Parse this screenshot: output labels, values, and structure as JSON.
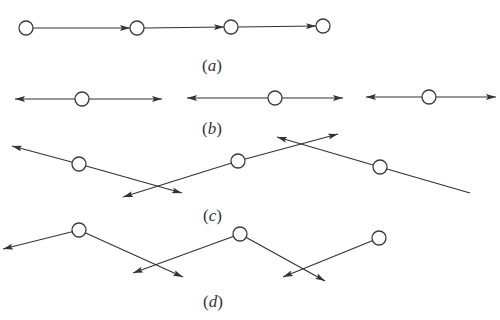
{
  "figure": {
    "style": {
      "line_color": "#333333",
      "node_fill": "#ffffff",
      "node_stroke": "#3a3a3a",
      "node_radius": 7
    },
    "panels": [
      {
        "id": "a",
        "label": "(a)",
        "label_letter": "a",
        "description": "Chain of four nodes connected left-to-right by directed arrows",
        "nodes": [
          {
            "x": 26,
            "y": 28
          },
          {
            "x": 137,
            "y": 28
          },
          {
            "x": 231,
            "y": 27
          },
          {
            "x": 323,
            "y": 26
          }
        ],
        "edges": [
          {
            "from": [
              33,
              28
            ],
            "to": [
              130,
              28
            ],
            "arrow_end": true
          },
          {
            "from": [
              144,
              28
            ],
            "to": [
              224,
              27
            ],
            "arrow_end": true
          },
          {
            "from": [
              238,
              27
            ],
            "to": [
              316,
              26
            ],
            "arrow_end": true
          }
        ]
      },
      {
        "id": "b",
        "label": "(b)",
        "label_letter": "b",
        "description": "Three isolated nodes each with a horizontal double-headed arrow",
        "nodes": [
          {
            "x": 82,
            "y": 99
          },
          {
            "x": 275,
            "y": 98
          },
          {
            "x": 429,
            "y": 97
          }
        ],
        "edges": [
          {
            "from": [
              82,
              99
            ],
            "to": [
              15,
              99
            ],
            "arrow_end": true
          },
          {
            "from": [
              82,
              99
            ],
            "to": [
              162,
              99
            ],
            "arrow_end": true
          },
          {
            "from": [
              275,
              98
            ],
            "to": [
              187,
              98
            ],
            "arrow_end": true
          },
          {
            "from": [
              275,
              98
            ],
            "to": [
              343,
              98
            ],
            "arrow_end": true
          },
          {
            "from": [
              429,
              97
            ],
            "to": [
              366,
              97
            ],
            "arrow_end": true
          },
          {
            "from": [
              429,
              97
            ],
            "to": [
              496,
              97
            ],
            "arrow_end": true
          }
        ]
      },
      {
        "id": "c",
        "label": "(c)",
        "label_letter": "c",
        "description": "Three nodes on tilted lines with arrows, lines crossing",
        "nodes": [
          {
            "x": 79,
            "y": 164
          },
          {
            "x": 238,
            "y": 161
          },
          {
            "x": 380,
            "y": 167
          }
        ],
        "edges": [
          {
            "from": [
              79,
              164
            ],
            "to": [
              12,
              146
            ],
            "arrow_end": true
          },
          {
            "from": [
              79,
              164
            ],
            "to": [
              182,
              193
            ],
            "arrow_end": true
          },
          {
            "from": [
              238,
              161
            ],
            "to": [
              123,
              197
            ],
            "arrow_end": true
          },
          {
            "from": [
              238,
              161
            ],
            "to": [
              338,
              134
            ],
            "arrow_end": true
          },
          {
            "from": [
              380,
              167
            ],
            "to": [
              277,
              137
            ],
            "arrow_end": true
          },
          {
            "from": [
              380,
              167
            ],
            "to": [
              470,
              193
            ],
            "arrow_end": false
          }
        ]
      },
      {
        "id": "d",
        "label": "(d)",
        "label_letter": "d",
        "description": "Three nodes with downward-pointing arrows forming a zigzag",
        "nodes": [
          {
            "x": 79,
            "y": 230
          },
          {
            "x": 240,
            "y": 234
          },
          {
            "x": 379,
            "y": 238
          }
        ],
        "edges": [
          {
            "from": [
              79,
              230
            ],
            "to": [
              3,
              249
            ],
            "arrow_end": true
          },
          {
            "from": [
              79,
              230
            ],
            "to": [
              183,
              277
            ],
            "arrow_end": true
          },
          {
            "from": [
              240,
              234
            ],
            "to": [
              133,
              273
            ],
            "arrow_end": true
          },
          {
            "from": [
              240,
              234
            ],
            "to": [
              325,
              281
            ],
            "arrow_end": true
          },
          {
            "from": [
              379,
              238
            ],
            "to": [
              283,
              277
            ],
            "arrow_end": true
          }
        ]
      }
    ]
  }
}
